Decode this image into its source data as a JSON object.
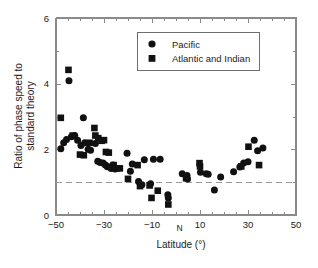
{
  "chart_data": {
    "type": "scatter",
    "title": "",
    "xlabel": "Latitude (°)",
    "ylabel": "Ratio of phase speed to standard theory",
    "ylabel_line1": "Ratio of phase speed to",
    "ylabel_line2": "standard theory",
    "xlim": [
      -50,
      50
    ],
    "ylim": [
      0,
      6
    ],
    "xticks": [
      -50,
      -30,
      -10,
      10,
      30,
      50
    ],
    "xtick_labels": [
      "−50",
      "−30",
      "−10",
      "10",
      "30",
      "50"
    ],
    "yticks": [
      0,
      2,
      4,
      6
    ],
    "ytick_labels": [
      "0",
      "2",
      "4",
      "6"
    ],
    "xminor_step": 5,
    "yminor_step": 1,
    "grid": false,
    "legend_position": "top-center",
    "annotations": [
      {
        "text": "N",
        "x": 1.5,
        "y": -0.48,
        "note": "northward direction marker near zero latitude"
      }
    ],
    "reference_line": {
      "orientation": "horizontal",
      "value": 1.0,
      "style": "dashed",
      "color": "#9a9a9a"
    },
    "series": [
      {
        "name": "Pacific",
        "marker": "circle",
        "color": "#111111",
        "points": [
          [
            -48.0,
            2.02
          ],
          [
            -46.8,
            2.2
          ],
          [
            -45.6,
            2.3
          ],
          [
            -44.6,
            4.09
          ],
          [
            -43.6,
            2.38
          ],
          [
            -42.2,
            2.42
          ],
          [
            -41.0,
            2.28
          ],
          [
            -39.6,
            2.12
          ],
          [
            -38.6,
            2.96
          ],
          [
            -38.0,
            2.2
          ],
          [
            -36.6,
            2.0
          ],
          [
            -35.6,
            1.97
          ],
          [
            -33.6,
            2.18
          ],
          [
            -32.6,
            1.64
          ],
          [
            -31.6,
            1.6
          ],
          [
            -30.4,
            1.58
          ],
          [
            -29.4,
            1.52
          ],
          [
            -28.6,
            1.47
          ],
          [
            -27.6,
            1.46
          ],
          [
            -27.0,
            1.42
          ],
          [
            -26.2,
            1.52
          ],
          [
            -25.4,
            1.4
          ],
          [
            -20.4,
            1.88
          ],
          [
            -19.0,
            1.33
          ],
          [
            -18.2,
            1.55
          ],
          [
            -15.6,
            1.02
          ],
          [
            -14.2,
            0.92
          ],
          [
            -13.2,
            1.68
          ],
          [
            -10.6,
            0.95
          ],
          [
            -9.4,
            1.7
          ],
          [
            -6.6,
            1.7
          ],
          [
            -3.4,
            0.62
          ],
          [
            -3.2,
            0.52
          ],
          [
            2.6,
            1.26
          ],
          [
            4.6,
            1.2
          ],
          [
            4.8,
            1.1
          ],
          [
            10.2,
            1.3
          ],
          [
            12.6,
            1.26
          ],
          [
            13.4,
            1.24
          ],
          [
            16.0,
            0.76
          ],
          [
            18.6,
            1.16
          ],
          [
            24.0,
            1.32
          ],
          [
            26.6,
            1.46
          ],
          [
            28.2,
            1.58
          ],
          [
            30.0,
            1.62
          ],
          [
            32.6,
            2.28
          ],
          [
            34.0,
            1.96
          ],
          [
            36.2,
            2.04
          ]
        ]
      },
      {
        "name": "Atlantic and Indian",
        "marker": "square",
        "color": "#111111",
        "points": [
          [
            -48.0,
            2.96
          ],
          [
            -44.8,
            4.42
          ],
          [
            -43.0,
            2.42
          ],
          [
            -40.0,
            1.84
          ],
          [
            -38.4,
            1.82
          ],
          [
            -36.0,
            2.2
          ],
          [
            -34.0,
            2.65
          ],
          [
            -33.6,
            2.42
          ],
          [
            -32.4,
            2.34
          ],
          [
            -31.0,
            2.26
          ],
          [
            -30.0,
            2.28
          ],
          [
            -29.2,
            1.92
          ],
          [
            -28.0,
            1.9
          ],
          [
            -26.0,
            1.52
          ],
          [
            -24.6,
            1.42
          ],
          [
            -23.4,
            1.42
          ],
          [
            -20.0,
            1.1
          ],
          [
            -16.0,
            1.52
          ],
          [
            -15.0,
            0.88
          ],
          [
            -11.0,
            0.9
          ],
          [
            -10.2,
            0.52
          ],
          [
            -7.6,
            0.74
          ],
          [
            -3.2,
            0.32
          ],
          [
            4.2,
            1.12
          ],
          [
            9.8,
            1.58
          ],
          [
            10.0,
            1.48
          ],
          [
            27.2,
            1.48
          ],
          [
            30.2,
            2.08
          ],
          [
            34.6,
            1.52
          ]
        ]
      }
    ]
  },
  "legend": {
    "entries": [
      {
        "label": "Pacific",
        "marker": "circle"
      },
      {
        "label": "Atlantic and Indian",
        "marker": "square"
      }
    ]
  }
}
